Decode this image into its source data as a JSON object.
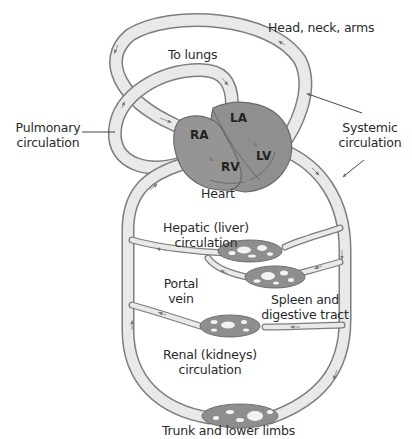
{
  "diagram": {
    "type": "human circulatory system schematic",
    "colors": {
      "background": "#ffffff",
      "vessel_fill": "#e9e9e9",
      "vessel_outline": "#7d7d7d",
      "heart_fill": "#8f8f8f",
      "heart_outline": "#6a6a6a",
      "capillary_bed": "#8e8e8e",
      "text": "#2a2a2a"
    },
    "labels": {
      "head_neck_arms": "Head, neck, arms",
      "to_lungs": "To lungs",
      "pulmonary_line1": "Pulmonary",
      "pulmonary_line2": "circulation",
      "systemic_line1": "Systemic",
      "systemic_line2": "circulation",
      "heart": "Heart",
      "hepatic_line1": "Hepatic (liver)",
      "hepatic_line2": "circulation",
      "portal_line1": "Portal",
      "portal_line2": "vein",
      "spleen_line1": "Spleen and",
      "spleen_line2": "digestive tract",
      "renal_line1": "Renal (kidneys)",
      "renal_line2": "circulation",
      "trunk": "Trunk and lower limbs"
    },
    "heart_chambers": {
      "ra": "RA",
      "la": "LA",
      "rv": "RV",
      "lv": "LV"
    },
    "circuits": [
      {
        "name": "Pulmonary circulation",
        "destination": "To lungs"
      },
      {
        "name": "Systemic circulation",
        "destinations": [
          "Head, neck, arms",
          "Hepatic (liver) circulation",
          "Spleen and digestive tract",
          "Renal (kidneys) circulation",
          "Trunk and lower limbs"
        ]
      }
    ]
  }
}
